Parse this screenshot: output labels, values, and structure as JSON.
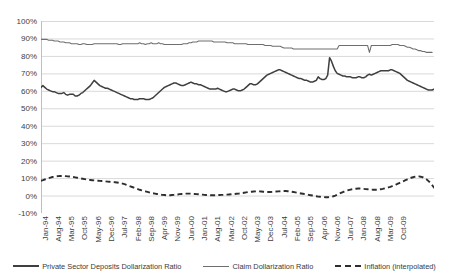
{
  "chart_data": {
    "type": "line",
    "title": "",
    "xlabel": "",
    "ylabel": "",
    "ylim": [
      -10,
      100
    ],
    "ytick_labels": [
      "100%",
      "90%",
      "80%",
      "70%",
      "60%",
      "50%",
      "40%",
      "30%",
      "20%",
      "10%",
      "0%",
      "-10%"
    ],
    "ytick_values": [
      100,
      90,
      80,
      70,
      60,
      50,
      40,
      30,
      20,
      10,
      0,
      -10
    ],
    "grid": true,
    "legend_position": "bottom",
    "xtick_labels": [
      "Jan-94",
      "Aug-94",
      "Mar-95",
      "Oct-95",
      "May-96",
      "Dec-96",
      "Jul-97",
      "Feb-98",
      "Sep-98",
      "Apr-99",
      "Nov-99",
      "Jun-00",
      "Jan-01",
      "Aug-01",
      "Mar-02",
      "Oct-02",
      "May-03",
      "Dec-03",
      "Jul-04",
      "Feb-05",
      "Sep-05",
      "Apr-06",
      "Nov-06",
      "Jun-07",
      "Jan-08",
      "Aug-08",
      "Mar-09",
      "Oct-09"
    ],
    "x_start": "Jan-94",
    "x_end": "Oct-09",
    "x_interval_months": 1,
    "xtick_interval_months": 7,
    "series": [
      {
        "name": "Private Sector Deposits Dollarization Ratio",
        "style": "solid-thick",
        "color": "#3f3f3f",
        "values": [
          62,
          63,
          62,
          61,
          60.5,
          60,
          59.5,
          59.5,
          59,
          58.5,
          58.5,
          58.5,
          59,
          58,
          57.5,
          58,
          58,
          58,
          57,
          57,
          57.5,
          58.5,
          59,
          60,
          61,
          62,
          63,
          64.5,
          66,
          65,
          64,
          63,
          62.5,
          62,
          61.5,
          61.5,
          61,
          60.5,
          60,
          59.5,
          59,
          58.5,
          58,
          57.5,
          57,
          56.5,
          56,
          55.5,
          55.5,
          55,
          55,
          55,
          55.5,
          55.5,
          55.5,
          55,
          55,
          55,
          55.5,
          56,
          57,
          58,
          59,
          60,
          61,
          62,
          62.5,
          63,
          63.5,
          64,
          64.5,
          64.5,
          64,
          63.5,
          63,
          63,
          63.5,
          64,
          64.5,
          65,
          64.5,
          64,
          64,
          63.5,
          63.5,
          63,
          62.5,
          62,
          61.5,
          61,
          61,
          61,
          61,
          61.5,
          61,
          60.5,
          60,
          59.5,
          59.5,
          60,
          60.5,
          61,
          61,
          60.5,
          60,
          60,
          60.5,
          61,
          62,
          63,
          64,
          64,
          63.5,
          63.5,
          64,
          65,
          66,
          67,
          68,
          69,
          69.5,
          70,
          70.5,
          71,
          71.5,
          72,
          72,
          71.5,
          71,
          70.5,
          70,
          69.5,
          69,
          68.5,
          68,
          67.5,
          67,
          67,
          66.5,
          66,
          66,
          65.5,
          65,
          65,
          65.5,
          66,
          68,
          67,
          66.5,
          66.5,
          67,
          69,
          79,
          77,
          74,
          71.5,
          70,
          69.5,
          69,
          68.5,
          68.5,
          68,
          68,
          68,
          67.5,
          67.5,
          67.5,
          68,
          68,
          67.5,
          67.5,
          68,
          69,
          69.5,
          69,
          69.5,
          70,
          70.5,
          71,
          71.5,
          71.5,
          71.5,
          71.5,
          71.5,
          72,
          72,
          71.5,
          71,
          70.5,
          70,
          69,
          68,
          67,
          66,
          65.5,
          65,
          64.5,
          64,
          63.5,
          63,
          62.5,
          62,
          61.5,
          61,
          60.5,
          60.5,
          60.5,
          61
        ]
      },
      {
        "name": "Claim Dollarization Ratio",
        "style": "solid-thin",
        "color": "#6e6e6e",
        "values": [
          89.5,
          89.5,
          89.5,
          89.5,
          89,
          89,
          89,
          88.5,
          88.5,
          88.5,
          88,
          88,
          88,
          87.5,
          87.5,
          87.5,
          87,
          87,
          87,
          87,
          86.5,
          86.5,
          87,
          87,
          86.5,
          86.5,
          86.5,
          86.5,
          87,
          87,
          87,
          87,
          87,
          87,
          87,
          87,
          87,
          87,
          87,
          87,
          87,
          86.5,
          86.5,
          87,
          87,
          87,
          87,
          87,
          87,
          87,
          87,
          87,
          87.5,
          87,
          87,
          86.5,
          87,
          87,
          87.5,
          87,
          87,
          87,
          87.5,
          87,
          87,
          86.5,
          86.5,
          86.5,
          86.5,
          86.5,
          86.5,
          86.5,
          86.5,
          86.5,
          86.5,
          87,
          87,
          87,
          87.5,
          87.5,
          88,
          88,
          88,
          88.5,
          88.5,
          88.5,
          88.5,
          88.5,
          88.5,
          88.5,
          88.5,
          88,
          88,
          88,
          88,
          88,
          88,
          88,
          87.5,
          87.5,
          87.5,
          87.5,
          87,
          87,
          87,
          87,
          87,
          87,
          87,
          86.5,
          86.5,
          86.5,
          86.5,
          86.5,
          86.5,
          86.5,
          86.5,
          86.5,
          86,
          86,
          86,
          86,
          85.5,
          85.5,
          85.5,
          85.5,
          85.5,
          85,
          84.5,
          84.5,
          84.5,
          84.5,
          84.5,
          84,
          84,
          84,
          84,
          84,
          84,
          84,
          84,
          84,
          84,
          84,
          84,
          84,
          84,
          84,
          84,
          84,
          84,
          84,
          84,
          84,
          84,
          84,
          84,
          86,
          86,
          86,
          86,
          86,
          86,
          86,
          86,
          86,
          86,
          86,
          86,
          86,
          86,
          86,
          86,
          82,
          86,
          86,
          86,
          86,
          86,
          86,
          86,
          86,
          86,
          86,
          86,
          86.5,
          86.5,
          86.5,
          86.5,
          86,
          86,
          86,
          85.5,
          85,
          85,
          84.5,
          84,
          84,
          83.5,
          83,
          83,
          82.5,
          82.5,
          82,
          82,
          82,
          82
        ]
      },
      {
        "name": "Inflation (interpolated)",
        "style": "dashed",
        "color": "#2e2e2e",
        "values": [
          8.5,
          8.8,
          9.2,
          9.6,
          10,
          10.3,
          10.6,
          10.8,
          11,
          11.1,
          11.2,
          11.2,
          11.2,
          11.1,
          11,
          10.9,
          10.8,
          10.6,
          10.4,
          10.2,
          10,
          9.8,
          9.6,
          9.4,
          9.2,
          9,
          8.9,
          8.8,
          8.7,
          8.6,
          8.5,
          8.4,
          8.3,
          8.2,
          8.1,
          8,
          7.9,
          7.8,
          7.7,
          7.6,
          7.5,
          7.3,
          7.1,
          6.8,
          6.5,
          6.1,
          5.7,
          5.3,
          4.9,
          4.5,
          4.1,
          3.7,
          3.3,
          3,
          2.7,
          2.4,
          2.1,
          1.8,
          1.5,
          1.3,
          1.1,
          0.9,
          0.7,
          0.5,
          0.4,
          0.3,
          0.2,
          0.2,
          0.2,
          0.3,
          0.4,
          0.5,
          0.6,
          0.8,
          0.9,
          1,
          1.1,
          1.1,
          1.1,
          1.1,
          1,
          0.9,
          0.8,
          0.7,
          0.6,
          0.5,
          0.4,
          0.3,
          0.3,
          0.2,
          0.2,
          0.2,
          0.2,
          0.3,
          0.3,
          0.4,
          0.4,
          0.5,
          0.5,
          0.6,
          0.7,
          0.8,
          0.9,
          1,
          1.1,
          1.2,
          1.4,
          1.6,
          1.8,
          2,
          2.1,
          2.2,
          2.3,
          2.4,
          2.4,
          2.4,
          2.3,
          2.2,
          2.1,
          2,
          2,
          2,
          2.1,
          2.2,
          2.3,
          2.4,
          2.5,
          2.6,
          2.6,
          2.6,
          2.5,
          2.4,
          2.2,
          2,
          1.8,
          1.6,
          1.4,
          1.2,
          1,
          0.8,
          0.6,
          0.4,
          0.2,
          0,
          -0.2,
          -0.4,
          -0.6,
          -0.7,
          -0.8,
          -0.9,
          -1,
          -1,
          -0.9,
          -0.7,
          -0.4,
          0,
          0.5,
          1,
          1.5,
          2,
          2.4,
          2.8,
          3.1,
          3.4,
          3.6,
          3.8,
          3.9,
          4,
          4,
          3.9,
          3.8,
          3.7,
          3.6,
          3.5,
          3.4,
          3.3,
          3.3,
          3.3,
          3.4,
          3.6,
          3.8,
          4.1,
          4.4,
          4.7,
          5,
          5.4,
          5.8,
          6.3,
          6.8,
          7.3,
          7.8,
          8.3,
          8.8,
          9.3,
          9.8,
          10.2,
          10.5,
          10.8,
          11,
          11,
          10.8,
          10.5,
          10,
          9.3,
          8.4,
          7.3,
          6,
          4.6,
          3.2,
          2,
          1.2,
          0.8,
          0.7,
          0.8,
          1
        ]
      }
    ]
  },
  "legend": {
    "items": [
      {
        "label": "Private Sector Deposits Dollarization Ratio"
      },
      {
        "label": "Claim Dollarization Ratio"
      },
      {
        "label": "Inflation (interpolated)"
      }
    ]
  },
  "colors": {
    "gridline": "#d9d9d9",
    "axis": "#bfbfbf",
    "text": "#404040",
    "deposits": "#3f3f3f",
    "claims": "#6e6e6e",
    "inflation": "#2e2e2e"
  }
}
